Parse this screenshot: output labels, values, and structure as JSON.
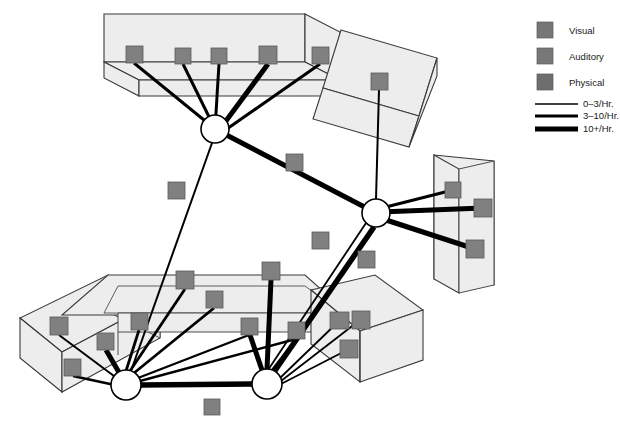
{
  "figure": {
    "type": "network-diagram",
    "background_color": "#ffffff",
    "slab_fill_color": "#ededed",
    "slab_stroke_color": "#3a3a3a",
    "square_color": "#808080",
    "square_stroke_color": "#5a5a5a",
    "hub_fill_color": "#ffffff",
    "hub_stroke_color": "#000000",
    "edge_color": "#000000"
  },
  "legend": {
    "categories": [
      {
        "label": "Visual",
        "swatch_color": "#777777",
        "icon": "square-swatch-icon"
      },
      {
        "label": "Auditory",
        "swatch_color": "#787878",
        "icon": "square-swatch-icon"
      },
      {
        "label": "Physical",
        "swatch_color": "#6e6e6e",
        "icon": "square-swatch-icon"
      }
    ],
    "edge_weights": [
      {
        "label": "0–3/Hr.",
        "stroke_width": 1.4,
        "icon": "thin-line-icon"
      },
      {
        "label": "3–10/Hr.",
        "stroke_width": 3.0,
        "icon": "medium-line-icon"
      },
      {
        "label": "10+/Hr.",
        "stroke_width": 5.0,
        "icon": "thick-line-icon"
      }
    ]
  },
  "hubs": [
    {
      "id": "hub-top",
      "cx": 215,
      "cy": 129,
      "r": 14
    },
    {
      "id": "hub-right",
      "cx": 376,
      "cy": 213,
      "r": 14
    },
    {
      "id": "hub-bottom-left",
      "cx": 126,
      "cy": 385,
      "r": 15
    },
    {
      "id": "hub-bottom-center",
      "cx": 267,
      "cy": 384,
      "r": 15
    }
  ],
  "slabs": [
    {
      "id": "slab-top",
      "name": "top-room-slab",
      "top_face": "104,14 305,14 305,62 104,62",
      "front_face": "104,62 305,62 296,92 113,92",
      "squares": [
        {
          "x": 126,
          "y": 46,
          "w": 17,
          "h": 17
        },
        {
          "x": 175,
          "y": 48,
          "w": 16,
          "h": 16
        },
        {
          "x": 211,
          "y": 48,
          "w": 16,
          "h": 16
        },
        {
          "x": 259,
          "y": 46,
          "w": 18,
          "h": 18
        },
        {
          "x": 312,
          "y": 47,
          "w": 17,
          "h": 17
        }
      ]
    },
    {
      "id": "slab-tilted-top-right",
      "name": "tilted-room-slab",
      "top_face": "341,30 435,57 417,113 323,86",
      "front_face": "323,86 417,113 409,143 315,116",
      "squares": [
        {
          "x": 371,
          "y": 73,
          "w": 17,
          "h": 17
        }
      ]
    },
    {
      "id": "slab-right",
      "name": "right-room-slab",
      "top_face": "434,155 494,160 494,278 434,283",
      "front_face": "434,155 459,168 459,272 434,283",
      "squares": [
        {
          "x": 445,
          "y": 176,
          "w": 16,
          "h": 16
        },
        {
          "x": 474,
          "y": 199,
          "w": 18,
          "h": 18
        },
        {
          "x": 466,
          "y": 240,
          "w": 18,
          "h": 18
        }
      ]
    },
    {
      "id": "slab-bottom-left-angled",
      "name": "bottom-left-angled-slab",
      "squares": [
        {
          "x": 50,
          "y": 317,
          "w": 18,
          "h": 18
        },
        {
          "x": 64,
          "y": 359,
          "w": 17,
          "h": 17
        },
        {
          "x": 97,
          "y": 333,
          "w": 17,
          "h": 17
        }
      ]
    },
    {
      "id": "slab-bottom-center",
      "name": "bottom-center-room-slab",
      "squares": [
        {
          "x": 131,
          "y": 313,
          "w": 17,
          "h": 17
        },
        {
          "x": 176,
          "y": 271,
          "w": 18,
          "h": 18
        },
        {
          "x": 206,
          "y": 291,
          "w": 17,
          "h": 17
        },
        {
          "x": 262,
          "y": 262,
          "w": 18,
          "h": 18
        },
        {
          "x": 241,
          "y": 318,
          "w": 17,
          "h": 17
        },
        {
          "x": 288,
          "y": 322,
          "w": 17,
          "h": 17
        }
      ]
    },
    {
      "id": "slab-bottom-right",
      "name": "bottom-right-room-slab",
      "squares": [
        {
          "x": 330,
          "y": 312,
          "w": 17,
          "h": 17
        },
        {
          "x": 351,
          "y": 311,
          "w": 17,
          "h": 17
        },
        {
          "x": 340,
          "y": 340,
          "w": 17,
          "h": 17
        }
      ]
    }
  ],
  "free_squares": [
    {
      "x": 168,
      "y": 182,
      "w": 17,
      "h": 17
    },
    {
      "x": 286,
      "y": 154,
      "w": 17,
      "h": 17
    },
    {
      "x": 312,
      "y": 232,
      "w": 17,
      "h": 17
    },
    {
      "x": 358,
      "y": 251,
      "w": 17,
      "h": 17
    },
    {
      "x": 204,
      "y": 399,
      "w": 16,
      "h": 16
    }
  ],
  "edges": [
    {
      "from": "slab-top.0",
      "to": "hub-top",
      "weight": "3-10"
    },
    {
      "from": "slab-top.1",
      "to": "hub-top",
      "weight": "3-10"
    },
    {
      "from": "slab-top.2",
      "to": "hub-top",
      "weight": "3-10"
    },
    {
      "from": "slab-top.3",
      "to": "hub-top",
      "weight": "10+"
    },
    {
      "from": "slab-top.4",
      "to": "hub-top",
      "weight": "3-10"
    },
    {
      "from": "hub-top",
      "to": "hub-right",
      "weight": "10+"
    },
    {
      "from": "hub-top",
      "to": "hub-bottom-left",
      "weight": "0-3"
    },
    {
      "from": "slab-tilted.0",
      "to": "hub-right",
      "weight": "0-3"
    },
    {
      "from": "slab-right.0",
      "to": "hub-right",
      "weight": "3-10"
    },
    {
      "from": "slab-right.1",
      "to": "hub-right",
      "weight": "10+"
    },
    {
      "from": "slab-right.2",
      "to": "hub-right",
      "weight": "10+"
    },
    {
      "from": "hub-right",
      "to": "hub-bottom-center",
      "weight": "10+"
    },
    {
      "from": "hub-bottom-left",
      "to": "hub-bottom-center",
      "weight": "10+"
    },
    {
      "from": "slab-bl.0",
      "to": "hub-bottom-left",
      "weight": "0-3"
    },
    {
      "from": "slab-bl.1",
      "to": "hub-bottom-left",
      "weight": "3-10"
    },
    {
      "from": "slab-bl.2",
      "to": "hub-bottom-left",
      "weight": "10+"
    },
    {
      "from": "slab-bc.0",
      "to": "hub-bottom-left",
      "weight": "3-10"
    },
    {
      "from": "slab-bc.1",
      "to": "hub-bottom-left",
      "weight": "3-10"
    },
    {
      "from": "slab-bc.2",
      "to": "hub-bottom-left",
      "weight": "3-10"
    },
    {
      "from": "slab-bc.3",
      "to": "hub-bottom-center",
      "weight": "10+"
    },
    {
      "from": "slab-bc.4",
      "to": "hub-bottom-center",
      "weight": "10+"
    },
    {
      "from": "slab-br.0",
      "to": "hub-bottom-center",
      "weight": "0-3"
    },
    {
      "from": "slab-br.1",
      "to": "hub-bottom-center",
      "weight": "0-3"
    },
    {
      "from": "slab-br.2",
      "to": "hub-bottom-center",
      "weight": "0-3"
    }
  ]
}
